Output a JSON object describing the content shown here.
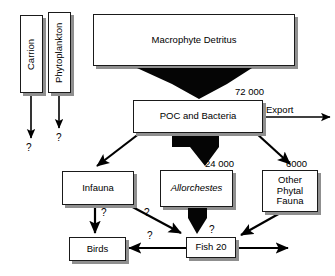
{
  "diagram": {
    "colors": {
      "box_fill": "#ffffff",
      "box_border": "#1a1a1a",
      "shadow": "#8f8f8f",
      "flow_arrow": "#000000",
      "background": "#ffffff"
    },
    "nodes": [
      {
        "id": "carrion",
        "label": "Carrion",
        "orientation": "vertical",
        "x": 20,
        "y": 15,
        "w": 23,
        "h": 78
      },
      {
        "id": "phytoplankton",
        "label": "Phytoplankton",
        "orientation": "vertical",
        "x": 48,
        "y": 12,
        "w": 23,
        "h": 81
      },
      {
        "id": "macrophyte",
        "label": "Macrophyte Detritus",
        "orientation": "horizontal",
        "x": 93,
        "y": 14,
        "w": 202,
        "h": 52
      },
      {
        "id": "poc",
        "label": "POC and Bacteria",
        "orientation": "horizontal",
        "x": 133,
        "y": 100,
        "w": 130,
        "h": 33
      },
      {
        "id": "infauna",
        "label": "Infauna",
        "orientation": "horizontal",
        "x": 62,
        "y": 171,
        "w": 72,
        "h": 34
      },
      {
        "id": "allorchestes",
        "label": "Allorchestes",
        "orientation": "horizontal",
        "x": 160,
        "y": 170,
        "w": 73,
        "h": 37,
        "italic": true
      },
      {
        "id": "other_phytal",
        "label": "Other\nPhytal\nFauna",
        "lines": [
          "Other",
          "Phytal",
          "Fauna"
        ],
        "orientation": "horizontal",
        "x": 262,
        "y": 170,
        "w": 56,
        "h": 42
      },
      {
        "id": "birds",
        "label": "Birds",
        "orientation": "horizontal",
        "x": 69,
        "y": 237,
        "w": 57,
        "h": 24
      },
      {
        "id": "fish",
        "label": "Fish 20",
        "orientation": "horizontal",
        "x": 186,
        "y": 237,
        "w": 50,
        "h": 21
      }
    ],
    "flow_labels": [
      {
        "id": "flux-72000",
        "text": "72 000",
        "x": 235,
        "y": 86
      },
      {
        "id": "flux-24000",
        "text": "24 000",
        "x": 205,
        "y": 158
      },
      {
        "id": "flux-6000",
        "text": "6000",
        "x": 286,
        "y": 158
      },
      {
        "id": "export",
        "text": "Export",
        "x": 266,
        "y": 105
      }
    ],
    "unknown_markers": [
      {
        "id": "q-carrion",
        "text": "?",
        "x": 26,
        "y": 142
      },
      {
        "id": "q-phytoplankton",
        "text": "?",
        "x": 56,
        "y": 132
      },
      {
        "id": "q-infauna-birds",
        "text": "?",
        "x": 101,
        "y": 209
      },
      {
        "id": "q-infauna-fish",
        "text": "?",
        "x": 144,
        "y": 209
      },
      {
        "id": "q-birds-fish",
        "text": "?",
        "x": 147,
        "y": 231
      },
      {
        "id": "q-fish-right",
        "text": "?",
        "x": 209,
        "y": 226
      }
    ],
    "edges": [
      {
        "id": "carrion-down",
        "from": "carrion",
        "to": "unknown",
        "style": "thin-arrow"
      },
      {
        "id": "phytoplankton-down",
        "from": "phytoplankton",
        "to": "unknown",
        "style": "thin-arrow"
      },
      {
        "id": "macrophyte-poc",
        "from": "macrophyte",
        "to": "poc",
        "style": "thick-funnel",
        "value": "72 000"
      },
      {
        "id": "poc-export",
        "from": "poc",
        "to": "export",
        "style": "thin-arrow",
        "value": "Export"
      },
      {
        "id": "poc-infauna",
        "from": "poc",
        "to": "infauna",
        "style": "thin-arrow"
      },
      {
        "id": "poc-allorchestes",
        "from": "poc",
        "to": "allorchestes",
        "style": "thick-funnel",
        "value": "24 000"
      },
      {
        "id": "poc-other-phytal",
        "from": "poc",
        "to": "other_phytal",
        "style": "thin-arrow",
        "value": "6000"
      },
      {
        "id": "infauna-birds",
        "from": "infauna",
        "to": "birds",
        "style": "thin-arrow",
        "value": "?"
      },
      {
        "id": "infauna-fish",
        "from": "infauna",
        "to": "fish",
        "style": "thin-arrow",
        "value": "?"
      },
      {
        "id": "allorchestes-fish",
        "from": "allorchestes",
        "to": "fish",
        "style": "thick-funnel",
        "value": "?"
      },
      {
        "id": "other-phytal-fish",
        "from": "other_phytal",
        "to": "fish",
        "style": "thin-arrow"
      },
      {
        "id": "fish-birds",
        "from": "fish",
        "to": "birds",
        "style": "thin-arrow",
        "value": "?"
      },
      {
        "id": "fish-export",
        "from": "fish",
        "to": "unknown",
        "style": "thin-arrow"
      }
    ]
  }
}
